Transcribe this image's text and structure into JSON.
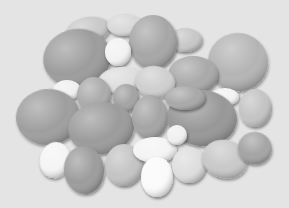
{
  "image": {
    "description": "Grayscale photograph of a pile of eggs of varying sizes and shades on a light gray background",
    "background_color": "#e4e4e4",
    "subject": "eggs",
    "egg_count_approx": 30
  },
  "eggs": [
    {
      "cx": 88,
      "cy": 30,
      "rx": 22,
      "ry": 13,
      "rot": -10,
      "shade": "#c9c9c9"
    },
    {
      "cx": 125,
      "cy": 25,
      "rx": 18,
      "ry": 11,
      "rot": 0,
      "shade": "#d8d8d8"
    },
    {
      "cx": 185,
      "cy": 40,
      "rx": 17,
      "ry": 12,
      "rot": 0,
      "shade": "#c8c8c8"
    },
    {
      "cx": 77,
      "cy": 58,
      "rx": 34,
      "ry": 29,
      "rot": -10,
      "shade": "#9c9c9c"
    },
    {
      "cx": 153,
      "cy": 42,
      "rx": 24,
      "ry": 27,
      "rot": 0,
      "shade": "#a6a6a6"
    },
    {
      "cx": 118,
      "cy": 52,
      "rx": 13,
      "ry": 14,
      "rot": 0,
      "shade": "#f2f2f2"
    },
    {
      "cx": 238,
      "cy": 62,
      "rx": 30,
      "ry": 29,
      "rot": 10,
      "shade": "#b4b4b4"
    },
    {
      "cx": 193,
      "cy": 75,
      "rx": 25,
      "ry": 19,
      "rot": 0,
      "shade": "#a9a9a9"
    },
    {
      "cx": 121,
      "cy": 80,
      "rx": 23,
      "ry": 13,
      "rot": -5,
      "shade": "#dedede"
    },
    {
      "cx": 155,
      "cy": 82,
      "rx": 20,
      "ry": 16,
      "rot": 10,
      "shade": "#cfcfcf"
    },
    {
      "cx": 67,
      "cy": 90,
      "rx": 14,
      "ry": 10,
      "rot": 0,
      "shade": "#f0f0f0"
    },
    {
      "cx": 94,
      "cy": 95,
      "rx": 17,
      "ry": 18,
      "rot": 0,
      "shade": "#ababab"
    },
    {
      "cx": 126,
      "cy": 98,
      "rx": 13,
      "ry": 14,
      "rot": 0,
      "shade": "#a3a3a3"
    },
    {
      "cx": 225,
      "cy": 97,
      "rx": 14,
      "ry": 9,
      "rot": 0,
      "shade": "#f3f3f3"
    },
    {
      "cx": 255,
      "cy": 108,
      "rx": 16,
      "ry": 19,
      "rot": 0,
      "shade": "#c4c4c4"
    },
    {
      "cx": 48,
      "cy": 117,
      "rx": 32,
      "ry": 28,
      "rot": -5,
      "shade": "#9e9e9e"
    },
    {
      "cx": 101,
      "cy": 128,
      "rx": 33,
      "ry": 26,
      "rot": -5,
      "shade": "#9b9b9b"
    },
    {
      "cx": 150,
      "cy": 117,
      "rx": 18,
      "ry": 22,
      "rot": 0,
      "shade": "#a4a4a4"
    },
    {
      "cx": 202,
      "cy": 118,
      "rx": 35,
      "ry": 28,
      "rot": 5,
      "shade": "#979797"
    },
    {
      "cx": 185,
      "cy": 98,
      "rx": 20,
      "ry": 12,
      "rot": 0,
      "shade": "#a8a8a8"
    },
    {
      "cx": 55,
      "cy": 160,
      "rx": 15,
      "ry": 18,
      "rot": 10,
      "shade": "#f5f5f5"
    },
    {
      "cx": 84,
      "cy": 170,
      "rx": 20,
      "ry": 24,
      "rot": -5,
      "shade": "#9c9c9c"
    },
    {
      "cx": 124,
      "cy": 165,
      "rx": 19,
      "ry": 21,
      "rot": 0,
      "shade": "#c4c4c4"
    },
    {
      "cx": 155,
      "cy": 150,
      "rx": 22,
      "ry": 13,
      "rot": 0,
      "shade": "#f4f4f4"
    },
    {
      "cx": 157,
      "cy": 177,
      "rx": 16,
      "ry": 20,
      "rot": 0,
      "shade": "#fafafa"
    },
    {
      "cx": 189,
      "cy": 165,
      "rx": 17,
      "ry": 18,
      "rot": 0,
      "shade": "#dedede"
    },
    {
      "cx": 225,
      "cy": 159,
      "rx": 23,
      "ry": 19,
      "rot": 15,
      "shade": "#c9c9c9"
    },
    {
      "cx": 255,
      "cy": 148,
      "rx": 17,
      "ry": 16,
      "rot": 15,
      "shade": "#a4a4a4"
    },
    {
      "cx": 177,
      "cy": 135,
      "rx": 10,
      "ry": 10,
      "rot": 0,
      "shade": "#f0f0f0"
    }
  ]
}
